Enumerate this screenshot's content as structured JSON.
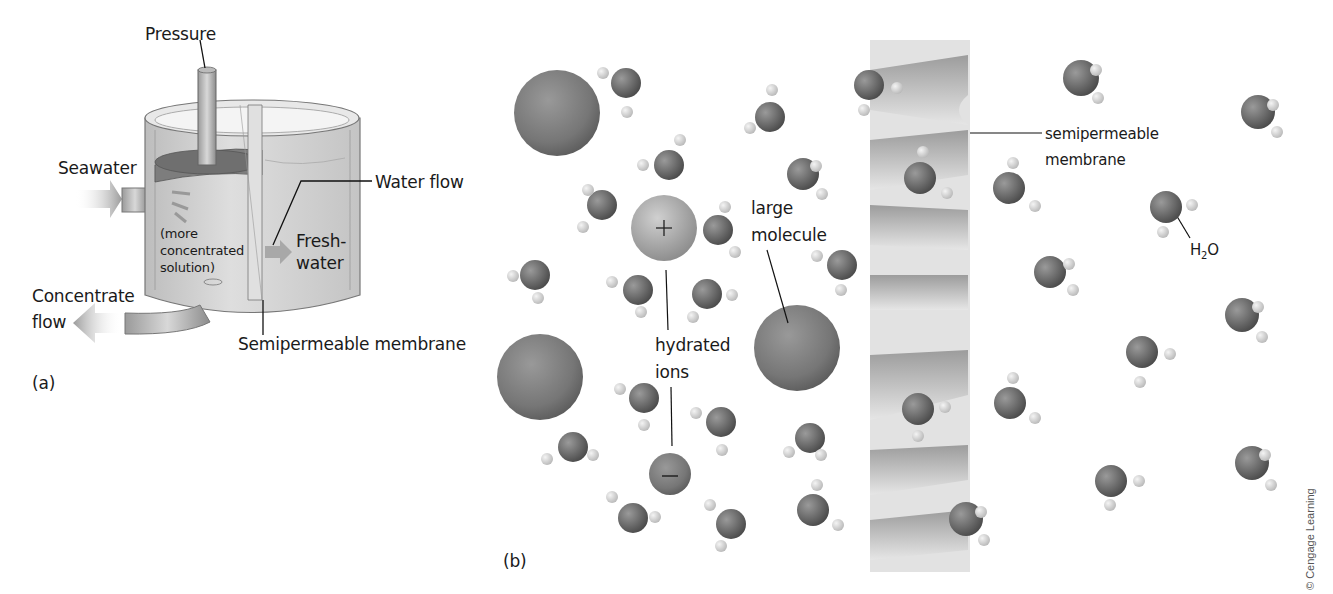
{
  "figure": {
    "panel_a": {
      "label": "(a)",
      "pressure": "Pressure",
      "seawater": "Seawater",
      "water_flow": "Water flow",
      "more_concentrated_1": "(more",
      "more_concentrated_2": "concentrated",
      "more_concentrated_3": "solution)",
      "freshwater_1": "Fresh-",
      "freshwater_2": "water",
      "concentrate_1": "Concentrate",
      "concentrate_2": "flow",
      "membrane": "Semipermeable membrane"
    },
    "panel_b": {
      "label": "(b)",
      "large_molecule_1": "large",
      "large_molecule_2": "molecule",
      "hydrated_ions_1": "hydrated",
      "hydrated_ions_2": "ions",
      "positive_sign": "+",
      "negative_sign": "−",
      "membrane_1": "semipermeable",
      "membrane_2": "membrane",
      "water_label": "H",
      "water_sub": "2",
      "water_o": "O"
    },
    "credit": "© Cengage Learning",
    "colors": {
      "oxygen": "#6e6e6e",
      "hydrogen": "#d9d9d9",
      "large_sphere": "#7a7a7a",
      "cation": "#a8a8a8",
      "membrane": "#d0d0d0",
      "tank": "#c8c8c8"
    }
  }
}
